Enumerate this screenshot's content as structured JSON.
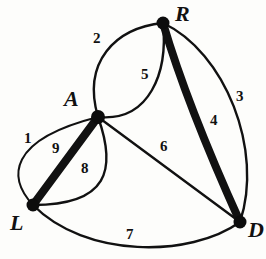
{
  "figure": {
    "background_color": "#fdfdfb",
    "ink_color": "#111111",
    "width": 266,
    "height": 259
  },
  "vertices": [
    {
      "id": "R",
      "label": "R",
      "x": 163,
      "y": 23,
      "label_x": 175,
      "label_y": 3,
      "dot_r": 6.5
    },
    {
      "id": "A",
      "label": "A",
      "x": 98,
      "y": 117,
      "label_x": 64,
      "label_y": 88,
      "dot_r": 7.0
    },
    {
      "id": "L",
      "label": "L",
      "x": 33,
      "y": 205,
      "label_x": 10,
      "label_y": 212,
      "dot_r": 6.5
    },
    {
      "id": "D",
      "label": "D",
      "x": 240,
      "y": 222,
      "label_x": 248,
      "label_y": 219,
      "dot_r": 6.5
    }
  ],
  "edges": [
    {
      "id": "e1",
      "label": "1",
      "from": "L",
      "to": "A",
      "weight": "thin",
      "stroke_width": 2.0,
      "label_x": 24,
      "label_y": 131,
      "path": "M 33 205 C 8 178 7 140 98 117"
    },
    {
      "id": "e2",
      "label": "2",
      "from": "A",
      "to": "R",
      "weight": "thin",
      "stroke_width": 2.4,
      "label_x": 93,
      "label_y": 31,
      "path": "M 98 117 C 82 62 115 28 163 23"
    },
    {
      "id": "e3",
      "label": "3",
      "from": "R",
      "to": "D",
      "weight": "thin",
      "stroke_width": 2.4,
      "label_x": 236,
      "label_y": 89,
      "path": "M 163 23 C 225 52 264 150 240 222"
    },
    {
      "id": "e4",
      "label": "4",
      "from": "R",
      "to": "D",
      "weight": "thick",
      "stroke_width": 8.0,
      "label_x": 210,
      "label_y": 113,
      "path": "M 163 23 C 182 88 212 160 240 222"
    },
    {
      "id": "e5",
      "label": "5",
      "from": "A",
      "to": "R",
      "weight": "thin",
      "stroke_width": 2.4,
      "label_x": 141,
      "label_y": 67,
      "path": "M 98 117 C 150 122 168 72 163 23"
    },
    {
      "id": "e6",
      "label": "6",
      "from": "A",
      "to": "D",
      "weight": "thin",
      "stroke_width": 2.4,
      "label_x": 160,
      "label_y": 139,
      "path": "M 98 117 L 240 222"
    },
    {
      "id": "e7",
      "label": "7",
      "from": "L",
      "to": "D",
      "weight": "thin",
      "stroke_width": 2.4,
      "label_x": 126,
      "label_y": 227,
      "path": "M 33 205 C 85 258 190 258 240 222"
    },
    {
      "id": "e8",
      "label": "8",
      "from": "L",
      "to": "A",
      "weight": "thin",
      "stroke_width": 2.4,
      "label_x": 81,
      "label_y": 161,
      "path": "M 33 205 C 108 205 117 170 98 117"
    },
    {
      "id": "e9",
      "label": "9",
      "from": "L",
      "to": "A",
      "weight": "thick",
      "stroke_width": 8.0,
      "label_x": 52,
      "label_y": 141,
      "path": "M 33 205 L 98 117"
    }
  ]
}
